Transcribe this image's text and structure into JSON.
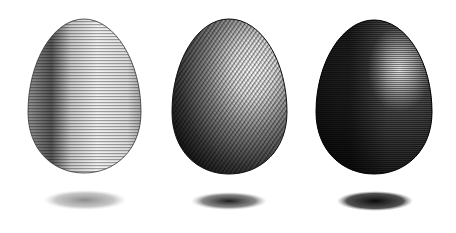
{
  "illustration": {
    "title": "Three engraved eggs with shadows",
    "background": "#ffffff",
    "eggs": [
      {
        "name": "light-egg",
        "style": "horizontal-hatching",
        "tone": "light",
        "base_color": "#e8e8e8",
        "shade_color": "#4a4a4a",
        "highlight_color": "#ffffff"
      },
      {
        "name": "medium-egg",
        "style": "diagonal-cross-hatching",
        "tone": "medium",
        "base_color": "#9a9a9a",
        "shade_color": "#1a1a1a",
        "highlight_color": "#ffffff"
      },
      {
        "name": "dark-egg",
        "style": "dense-horizontal-hatching",
        "tone": "dark",
        "base_color": "#3a3a3a",
        "shade_color": "#0a0a0a",
        "highlight_color": "#dcdcdc"
      }
    ],
    "shadows": [
      {
        "name": "light-egg-shadow",
        "color": "#8a8a8a"
      },
      {
        "name": "medium-egg-shadow",
        "color": "#2a2a2a"
      },
      {
        "name": "dark-egg-shadow",
        "color": "#1a1a1a"
      }
    ]
  }
}
